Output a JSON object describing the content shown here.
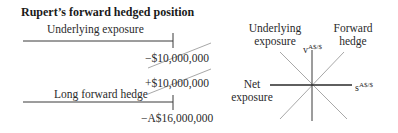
{
  "title": "Rupert’s forward hedged position",
  "left_panel": {
    "underlying_label": "Underlying exposure",
    "underlying_value": "−$10,000,000",
    "hedge_value_usd": "+$10,000,000",
    "hedge_label": "Long forward hedge",
    "hedge_value_aud": "−A$16,000,000"
  },
  "right_panel": {
    "underlying_label_line1": "Underlying",
    "underlying_label_line2": "exposure",
    "forward_label_line1": "Forward",
    "forward_label_line2": "hedge",
    "net_label_line1": "Net",
    "net_label_line2": "exposure",
    "y_axis_base": "v",
    "y_axis_sup": "A$/$",
    "x_axis_base": "s",
    "x_axis_sup": "A$/$"
  },
  "colors": {
    "line_dark": "#3a3a3a",
    "line_light": "#a8a8a8",
    "text": "#2a2a2a"
  }
}
